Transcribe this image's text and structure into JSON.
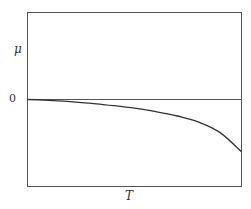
{
  "chart_data": {
    "type": "line",
    "title": "",
    "xlabel": "T",
    "ylabel": "μ",
    "y_tick_labels": [
      "0"
    ],
    "x_tick_labels": [],
    "grid": false,
    "legend": null,
    "reference_lines": [
      {
        "axis": "y",
        "value": 0
      }
    ],
    "xlim": [
      0,
      1
    ],
    "ylim": [
      -1,
      1.03
    ],
    "series": [
      {
        "name": "μ(T)",
        "x": [
          0,
          0.1,
          0.2,
          0.3,
          0.4,
          0.5,
          0.6,
          0.7,
          0.8,
          0.9,
          1.0
        ],
        "values": [
          0,
          -0.01,
          -0.025,
          -0.045,
          -0.07,
          -0.1,
          -0.14,
          -0.19,
          -0.26,
          -0.38,
          -0.6
        ]
      }
    ]
  },
  "labels": {
    "y_axis": "μ",
    "x_axis": "T",
    "zero_tick": "0"
  }
}
